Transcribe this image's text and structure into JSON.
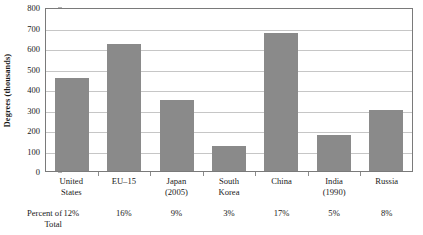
{
  "chart_data": {
    "type": "bar",
    "title": "",
    "xlabel": "",
    "ylabel": "Degrees (thousands)",
    "ylim": [
      0,
      800
    ],
    "ytick_values": [
      800,
      700,
      600,
      500,
      400,
      300,
      200,
      100,
      0
    ],
    "ytick_labels": [
      "800",
      "700",
      "600",
      "500",
      "400",
      "300",
      "200",
      "100",
      "0"
    ],
    "grid": true,
    "legend": "none",
    "bar_color": "#8a8a8a",
    "categories": [
      "United States",
      "EU–15",
      "Japan (2005)",
      "South Korea",
      "China",
      "India (1990)",
      "Russia"
    ],
    "values": [
      455,
      622,
      348,
      122,
      675,
      175,
      298
    ],
    "annotations": {
      "percent_row_label": "Percent of Total",
      "percent_of_total": [
        "12%",
        "16%",
        "9%",
        "3%",
        "17%",
        "5%",
        "8%"
      ]
    }
  },
  "axis": {
    "y_title": "Degrees (thousands)",
    "y_ticks": [
      {
        "label": "800",
        "value": 800
      },
      {
        "label": "700",
        "value": 700
      },
      {
        "label": "600",
        "value": 600
      },
      {
        "label": "500",
        "value": 500
      },
      {
        "label": "400",
        "value": 400
      },
      {
        "label": "300",
        "value": 300
      },
      {
        "label": "200",
        "value": 200
      },
      {
        "label": "100",
        "value": 100
      },
      {
        "label": "0",
        "value": 0
      }
    ]
  },
  "categories": [
    {
      "line1": "United",
      "line2": "States",
      "value": 455,
      "percent": "12%"
    },
    {
      "line1": "EU–15",
      "line2": "",
      "value": 622,
      "percent": "16%"
    },
    {
      "line1": "Japan",
      "line2": "(2005)",
      "value": 348,
      "percent": "9%"
    },
    {
      "line1": "South",
      "line2": "Korea",
      "value": 122,
      "percent": "3%"
    },
    {
      "line1": "China",
      "line2": "",
      "value": 675,
      "percent": "17%"
    },
    {
      "line1": "India",
      "line2": "(1990)",
      "value": 175,
      "percent": "5%"
    },
    {
      "line1": "Russia",
      "line2": "",
      "value": 298,
      "percent": "8%"
    }
  ],
  "percent_row": {
    "label_line1": "Percent of",
    "label_line2": "Total"
  }
}
